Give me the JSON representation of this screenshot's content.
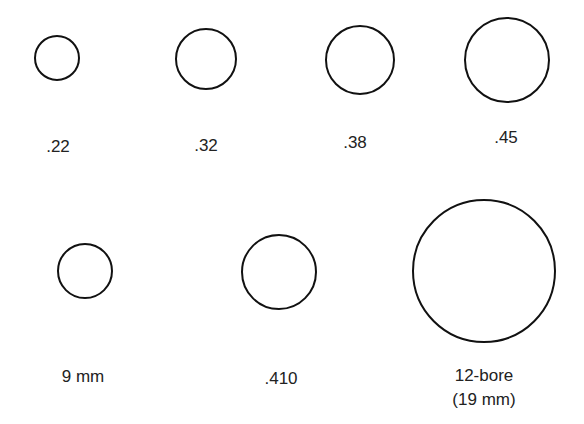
{
  "diagram": {
    "title": "",
    "stroke_color": "#111111",
    "items": [
      {
        "label": ".22",
        "cx": 57,
        "cy": 58,
        "r": 23,
        "lx": 58,
        "ly": 147
      },
      {
        "label": ".32",
        "cx": 206,
        "cy": 59,
        "r": 31,
        "lx": 206,
        "ly": 146
      },
      {
        "label": ".38",
        "cx": 360,
        "cy": 60,
        "r": 35,
        "lx": 355,
        "ly": 143
      },
      {
        "label": ".45",
        "cx": 507,
        "cy": 60,
        "r": 43,
        "lx": 506,
        "ly": 138
      },
      {
        "label": "9 mm",
        "cx": 85,
        "cy": 271,
        "r": 28,
        "lx": 83,
        "ly": 377
      },
      {
        "label": ".410",
        "cx": 279,
        "cy": 272,
        "r": 38,
        "lx": 281,
        "ly": 379
      },
      {
        "label": "12-bore",
        "label2": "(19 mm)",
        "cx": 484,
        "cy": 271,
        "r": 72,
        "lx": 484,
        "ly": 388
      }
    ]
  }
}
